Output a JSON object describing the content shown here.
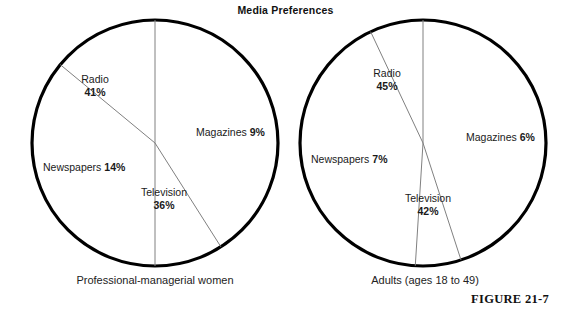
{
  "figure": {
    "title": "Media Preferences",
    "figure_number": "FIGURE 21-7",
    "background_color": "#ffffff",
    "outline_color": "#000000",
    "divider_color": "#808080",
    "text_color": "#1a1a1a"
  },
  "chart_data": {
    "type": "pie",
    "title": "Media Preferences",
    "unit": "%",
    "charts": [
      {
        "id": "professional-managerial-women",
        "caption": "Professional-managerial women",
        "center": {
          "x": 155,
          "y": 143
        },
        "radius": 123,
        "start_angle_deg": 0,
        "categories": [
          "Radio",
          "Magazines",
          "Television",
          "Newspapers"
        ],
        "values": [
          41,
          9,
          36,
          14
        ],
        "slices": [
          {
            "name": "Radio",
            "value": 41,
            "label": "Radio",
            "pct_label": "41%",
            "label_style": "stacked",
            "label_x": 95,
            "label_y": 73
          },
          {
            "name": "Magazines",
            "value": 9,
            "label": "Magazines",
            "pct_label": "9%",
            "label_style": "inline",
            "label_x": 197,
            "label_y": 126
          },
          {
            "name": "Television",
            "value": 36,
            "label": "Television",
            "pct_label": "36%",
            "label_style": "stacked",
            "label_x": 160,
            "label_y": 186
          },
          {
            "name": "Newspapers",
            "value": 14,
            "label": "Newspapers",
            "pct_label": "14%",
            "label_style": "inline",
            "label_x": 43,
            "label_y": 161
          }
        ]
      },
      {
        "id": "adults-ages-18-to-49",
        "caption": "Adults (ages 18 to 49)",
        "center": {
          "x": 423,
          "y": 143
        },
        "radius": 123,
        "start_angle_deg": 0,
        "categories": [
          "Radio",
          "Magazines",
          "Television",
          "Newspapers"
        ],
        "values": [
          45,
          6,
          42,
          7
        ],
        "slices": [
          {
            "name": "Radio",
            "value": 45,
            "label": "Radio",
            "pct_label": "45%",
            "label_style": "stacked",
            "label_x": 385,
            "label_y": 73
          },
          {
            "name": "Magazines",
            "value": 6,
            "label": "Magazines",
            "pct_label": "6%",
            "label_style": "inline",
            "label_x": 466,
            "label_y": 133
          },
          {
            "name": "Television",
            "value": 42,
            "label": "Television",
            "pct_label": "42%",
            "label_style": "stacked",
            "label_x": 427,
            "label_y": 193
          },
          {
            "name": "Newspapers",
            "value": 7,
            "label": "Newspapers",
            "pct_label": "7%",
            "label_style": "inline",
            "label_x": 311,
            "label_y": 156
          }
        ]
      }
    ]
  }
}
